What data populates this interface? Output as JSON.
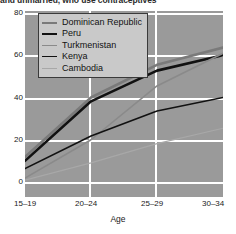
{
  "title": "and unmarried, who use contraceptives",
  "axis": {
    "x_label": "Age",
    "x_ticks": [
      "15–19",
      "20–24",
      "25–29",
      "30–34"
    ],
    "y_ticks": [
      "0",
      "20",
      "40",
      "60",
      "80"
    ]
  },
  "legend": {
    "items": [
      {
        "label": "Dominican Republic",
        "color": "#7a7a7a",
        "width": 2.6
      },
      {
        "label": "Peru",
        "color": "#111111",
        "width": 2.6
      },
      {
        "label": "Turkmenistan",
        "color": "#8a8a8a",
        "width": 1.6
      },
      {
        "label": "Kenya",
        "color": "#111111",
        "width": 1.6
      },
      {
        "label": "Cambodia",
        "color": "#a8a8a8",
        "width": 1.2
      }
    ]
  },
  "colors": {
    "plot_background": "#9a9a9a",
    "gridline": "#ffffff",
    "page_background": "#ffffff",
    "legend_background": "#c9c9c9",
    "legend_border": "#3a3a3a",
    "text": "#1a1a1a"
  },
  "chart_data": {
    "type": "line",
    "title": "and unmarried, who use contraceptives",
    "xlabel": "Age",
    "ylabel": "",
    "categories": [
      "15–19",
      "20–24",
      "25–29",
      "30–34"
    ],
    "ylim": [
      0,
      88
    ],
    "xlim": [
      0,
      3
    ],
    "grid": true,
    "legend_position": "upper-left",
    "series": [
      {
        "name": "Dominican Republic",
        "color": "#7a7a7a",
        "values": [
          13,
          44,
          61,
          70
        ]
      },
      {
        "name": "Peru",
        "color": "#111111",
        "values": [
          11,
          42,
          58,
          66
        ]
      },
      {
        "name": "Turkmenistan",
        "color": "#8a8a8a",
        "values": [
          2,
          22,
          50,
          67
        ]
      },
      {
        "name": "Kenya",
        "color": "#111111",
        "values": [
          7,
          24,
          37,
          44
        ]
      },
      {
        "name": "Cambodia",
        "color": "#a8a8a8",
        "values": [
          1,
          10,
          20,
          28
        ]
      }
    ]
  }
}
